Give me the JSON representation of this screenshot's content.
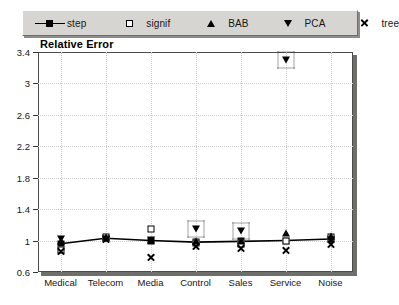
{
  "legend": {
    "entries": [
      {
        "label": "step",
        "marker": "line-filled-square"
      },
      {
        "label": "signif",
        "marker": "open-square"
      },
      {
        "label": "BAB",
        "marker": "triangle-up"
      },
      {
        "label": "PCA",
        "marker": "triangle-down"
      },
      {
        "label": "tree",
        "marker": "cross-x"
      }
    ]
  },
  "chart_data": {
    "type": "scatter",
    "title": "Relative Error",
    "xlabel": "",
    "ylabel": "",
    "ylim": [
      0.6,
      3.4
    ],
    "yticks": [
      0.6,
      1,
      1.4,
      1.8,
      2.2,
      2.6,
      3,
      3.4
    ],
    "ytick_labels": [
      "0.6",
      "1",
      "1.4",
      "1.8",
      "2.2",
      "2.6",
      "3",
      "3.4"
    ],
    "grid": true,
    "legend_position": "top",
    "categories": [
      "Medical",
      "Telecom",
      "Media",
      "Control",
      "Sales",
      "Service",
      "Noise"
    ],
    "series": [
      {
        "name": "step",
        "marker": "line-filled-square",
        "values": [
          0.96,
          1.03,
          1.0,
          0.98,
          0.99,
          1.0,
          1.02
        ]
      },
      {
        "name": "signif",
        "marker": "open-square",
        "values": [
          0.88,
          1.04,
          1.15,
          0.97,
          0.96,
          1.0,
          1.04
        ]
      },
      {
        "name": "BAB",
        "marker": "triangle-up",
        "values": [
          1.0,
          1.05,
          1.01,
          0.99,
          1.0,
          1.1,
          1.06
        ]
      },
      {
        "name": "PCA",
        "marker": "triangle-down",
        "values": [
          1.02,
          1.02,
          1.01,
          1.15,
          1.12,
          3.3,
          1.01
        ]
      },
      {
        "name": "tree",
        "marker": "cross-x",
        "values": [
          0.86,
          1.02,
          0.78,
          0.93,
          0.9,
          0.88,
          0.95
        ]
      }
    ],
    "highlights": [
      {
        "category": "Control",
        "series": "PCA",
        "value": 1.15
      },
      {
        "category": "Sales",
        "series": "PCA",
        "value": 1.12
      },
      {
        "category": "Service",
        "series": "PCA",
        "value": 3.3
      }
    ]
  },
  "colors": {
    "marker": "#000000",
    "panel": "#d6d5d1",
    "grid": "#cfcfcf",
    "frame": "#4b4b4b",
    "shadow": "#6e6e6b",
    "background": "#ffffff"
  }
}
